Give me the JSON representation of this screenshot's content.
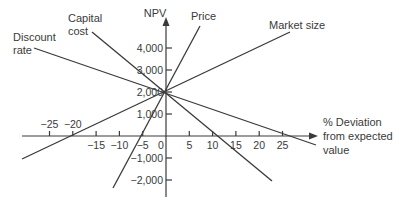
{
  "chart_data": {
    "type": "line",
    "title": "",
    "xlabel": "% Deviation from expected value",
    "ylabel": "NPV",
    "x_ticks": [
      -25,
      -20,
      -15,
      -10,
      -5,
      0,
      5,
      10,
      15,
      20,
      25
    ],
    "y_ticks": [
      -2000,
      -1000,
      1000,
      2000,
      3000,
      4000
    ],
    "y_tick_labels": [
      "−2,000",
      "−1,000",
      "1,000",
      "2,000",
      "3,000",
      "4,000"
    ],
    "x_tick_labels": [
      "−25",
      "−20",
      "−15",
      "−10",
      "−5",
      "0",
      "5",
      "10",
      "15",
      "20",
      "25"
    ],
    "xlim": [
      -30,
      30
    ],
    "ylim": [
      -2500,
      5500
    ],
    "grid": false,
    "legend": "inline labels at line ends",
    "center_point": {
      "x": 0,
      "y": 2000
    },
    "series": [
      {
        "name": "Discount rate",
        "x": [
          -28.5,
          0,
          25
        ],
        "y": [
          4000,
          2000,
          0
        ],
        "x_intercept": 25
      },
      {
        "name": "Capital cost",
        "x": [
          -16,
          0,
          11
        ],
        "y": [
          5500,
          2000,
          0
        ],
        "x_intercept": 11
      },
      {
        "name": "Price",
        "x": [
          7.5,
          0,
          -5
        ],
        "y": [
          5000,
          2000,
          0
        ],
        "x_intercept": -5
      },
      {
        "name": "Market size",
        "x": [
          27,
          0,
          -20
        ],
        "y": [
          5500,
          2000,
          0
        ],
        "x_intercept": -20
      }
    ]
  },
  "labels": {
    "y_axis": "NPV",
    "x_axis_line1": "% Deviation",
    "x_axis_line2": "from expected",
    "x_axis_line3": "value",
    "discount_line1": "Discount",
    "discount_line2": "rate",
    "capital_line1": "Capital",
    "capital_line2": "cost",
    "price": "Price",
    "market_size": "Market size"
  }
}
